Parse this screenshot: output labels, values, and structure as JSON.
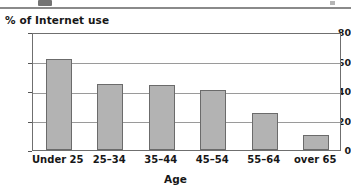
{
  "page": {
    "divider_rule": "page-divider"
  },
  "chart_data": {
    "type": "bar",
    "title": "% of Internet use",
    "xlabel": "Age",
    "ylabel": "",
    "categories": [
      "Under 25",
      "25–34",
      "35–44",
      "45–54",
      "55–64",
      "over 65"
    ],
    "values": [
      62,
      45,
      44,
      41,
      25,
      10
    ],
    "ylim": [
      0,
      80
    ],
    "ytick_labels": [
      "0",
      "20",
      "40",
      "60",
      "80"
    ],
    "ytick_values": [
      0,
      20,
      40,
      60,
      80
    ],
    "grid": true,
    "legend": false,
    "bar_color": "#b3b3b3",
    "bar_border_color": "#6b6b6b",
    "axis_color": "#6f6f6f",
    "grid_color": "#9a9a9a",
    "text_color": "#171717"
  }
}
